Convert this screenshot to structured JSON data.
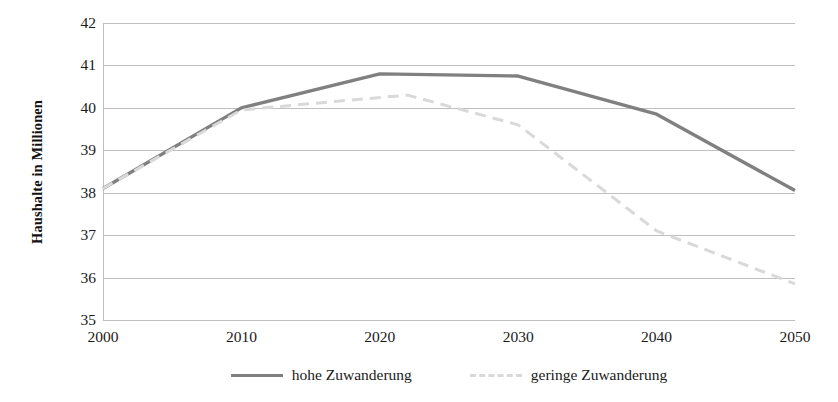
{
  "chart_data": {
    "type": "line",
    "title": "",
    "xlabel": "",
    "ylabel": "Haushalte in Millionen",
    "x": [
      2000,
      2010,
      2020,
      2030,
      2040,
      2050
    ],
    "xtick_labels": [
      "2000",
      "2010",
      "2020",
      "2030",
      "2040",
      "2050"
    ],
    "ytick_labels": [
      "42",
      "41",
      "40",
      "39",
      "38",
      "37",
      "36",
      "35"
    ],
    "xlim": [
      2000,
      2050
    ],
    "ylim": [
      35,
      42
    ],
    "grid": "horizontal",
    "legend_position": "bottom-center",
    "series": [
      {
        "name": "hohe Zuwanderung",
        "style": "solid",
        "color": "#808080",
        "x": [
          2000,
          2010,
          2020,
          2030,
          2040,
          2050
        ],
        "values": [
          38.1,
          40.0,
          40.8,
          40.75,
          39.85,
          38.05
        ]
      },
      {
        "name": "geringe Zuwanderung",
        "style": "dashed",
        "color": "#d9d9d9",
        "x": [
          2000,
          2010,
          2015,
          2022,
          2030,
          2040,
          2050
        ],
        "values": [
          38.1,
          39.95,
          40.1,
          40.3,
          39.6,
          37.1,
          35.85
        ]
      }
    ]
  },
  "axes": {
    "y_title": "Haushalte in Millionen"
  },
  "legend": {
    "entries": [
      {
        "label": "hohe Zuwanderung",
        "style": "solid",
        "color": "#808080"
      },
      {
        "label": "geringe Zuwanderung",
        "style": "dashed",
        "color": "#d9d9d9"
      }
    ]
  }
}
